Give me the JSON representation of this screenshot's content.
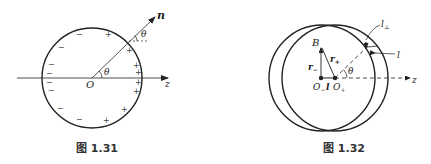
{
  "figures": [
    {
      "id": "fig-1-31",
      "caption": "图 1.31",
      "labels": {
        "normal": "n",
        "theta_center": "θ",
        "theta_surface": "θ",
        "origin": "O",
        "axis": "z"
      },
      "charges": {
        "negative": "−",
        "positive": "+"
      }
    },
    {
      "id": "fig-1-32",
      "caption": "图 1.32",
      "labels": {
        "point_b": "B",
        "r_minus": "r",
        "r_minus_sub": "−",
        "r_plus": "r",
        "r_plus_sub": "+",
        "o_minus": "O",
        "o_minus_sub": "−",
        "separation": "l",
        "o_plus": "O",
        "o_plus_sub": "+",
        "theta": "θ",
        "axis": "z",
        "l_perp": "l",
        "l_perp_sub": "⊥",
        "l_label": "l"
      }
    }
  ],
  "colors": {
    "stroke": "#222222",
    "background": "#ffffff"
  }
}
